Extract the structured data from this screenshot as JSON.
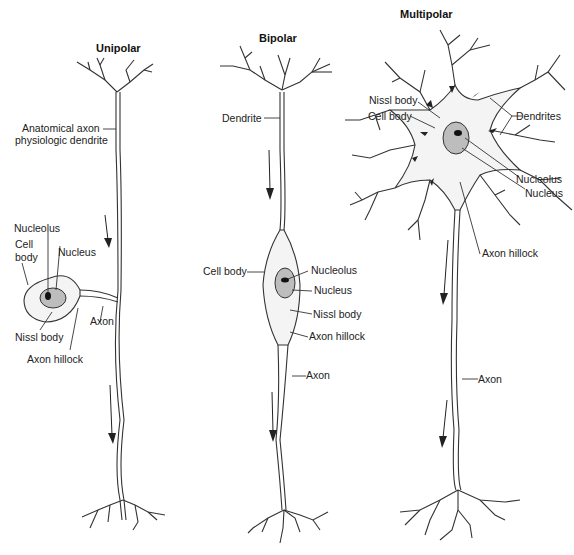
{
  "neurons": {
    "unipolar": {
      "title": "Unipolar",
      "labels": {
        "anatomical_1": "Anatomical axon",
        "anatomical_2": "physiologic dendrite",
        "nucleolus": "Nucleolus",
        "cell_body_1": "Cell",
        "cell_body_2": "body",
        "nucleus": "Nucleus",
        "axon": "Axon",
        "nissl": "Nissl body",
        "hillock": "Axon hillock"
      }
    },
    "bipolar": {
      "title": "Bipolar",
      "labels": {
        "dendrite": "Dendrite",
        "cell_body": "Cell body",
        "nucleolus": "Nucleolus",
        "nucleus": "Nucleus",
        "nissl": "Nissl body",
        "hillock": "Axon hillock",
        "axon": "Axon"
      }
    },
    "multipolar": {
      "title": "Multipolar",
      "labels": {
        "nissl": "Nissl body",
        "cell_body": "Cell body",
        "dendrites": "Dendrites",
        "nucleolus": "Nucleolus",
        "nucleus": "Nucleus",
        "hillock": "Axon hillock",
        "axon": "Axon"
      }
    }
  }
}
